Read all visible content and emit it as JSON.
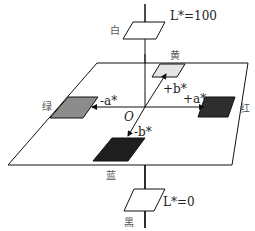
{
  "diagram": {
    "axis_top_label": "L*=100",
    "axis_bottom_label": "L*=0",
    "origin_label": "O",
    "colors": {
      "white_label": "白",
      "black_label": "黑",
      "yellow_label": "黄",
      "blue_label": "蓝",
      "green_label": "绿",
      "red_label": "红"
    },
    "axes": {
      "pos_a": "+a*",
      "neg_a": "-a*",
      "pos_b": "+b*",
      "neg_b": "-b*"
    },
    "patch_fills": {
      "yellow": "#e4e4e4",
      "green": "#8c8c8c",
      "red": "#2e2e2e",
      "blue": "#1e1e1e",
      "white_plane": "#ffffff",
      "black_plane": "#ffffff"
    }
  }
}
